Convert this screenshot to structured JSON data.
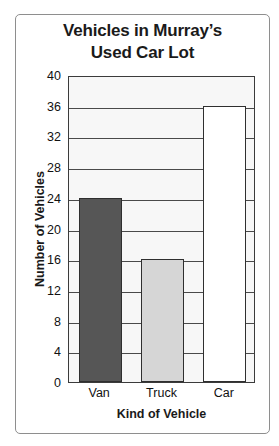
{
  "chart_data": {
    "type": "bar",
    "title": "Vehicles in Murray’s Used Car Lot",
    "title_line1": "Vehicles in Murray’s",
    "title_line2": "Used Car Lot",
    "xlabel": "Kind of Vehicle",
    "ylabel": "Number of Vehicles",
    "categories": [
      "Van",
      "Truck",
      "Car"
    ],
    "values": [
      24,
      16,
      36
    ],
    "bar_colors": [
      "#565656",
      "#d6d6d6",
      "#ffffff"
    ],
    "ylim": [
      0,
      40
    ],
    "ytick_step": 4,
    "yticks": [
      0,
      4,
      8,
      12,
      16,
      20,
      24,
      28,
      32,
      36,
      40
    ],
    "ytick_labels": [
      "0",
      "4",
      "8",
      "12",
      "16",
      "20",
      "24",
      "28",
      "32",
      "36",
      "40"
    ],
    "grid": true,
    "legend": false,
    "plot_background": "#f7f7f7",
    "axis_color": "#3b3b3b",
    "bar_edge_color": "#2f2f2f",
    "frame_color": "#8e8e8e"
  }
}
